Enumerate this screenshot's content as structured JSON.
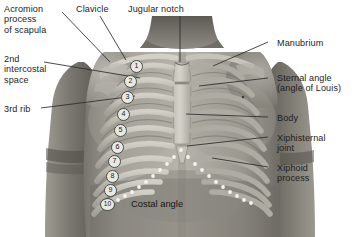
{
  "figure": {
    "background_color": "#ffffff",
    "text_color": "#1d1d1d",
    "leader_line_color": "#2b2b2b",
    "width": 364,
    "height": 237
  },
  "labels": {
    "left": [
      {
        "id": "acromion",
        "text": "Acromion\nprocess\nof scapula",
        "x": 4,
        "y": 4
      },
      {
        "id": "clavicle",
        "text": "Clavicle",
        "x": 76,
        "y": 4
      },
      {
        "id": "jugular",
        "text": "Jugular notch",
        "x": 128,
        "y": 4
      },
      {
        "id": "intercostal",
        "text": "2nd\nintercostal\nspace",
        "x": 4,
        "y": 54
      },
      {
        "id": "third-rib",
        "text": "3rd rib",
        "x": 4,
        "y": 104
      }
    ],
    "right": [
      {
        "id": "manubrium",
        "text": "Manubrium",
        "x": 277,
        "y": 38
      },
      {
        "id": "sternal-angle",
        "text": "Sternal angle\n(angle of Louis)",
        "x": 277,
        "y": 73
      },
      {
        "id": "body",
        "text": "Body",
        "x": 277,
        "y": 113
      },
      {
        "id": "xiphisternal",
        "text": "Xiphisternal\njoint",
        "x": 277,
        "y": 133
      },
      {
        "id": "xiphoid",
        "text": "Xiphoid\nprocess",
        "x": 277,
        "y": 163
      }
    ],
    "inline": [
      {
        "id": "costal-angle",
        "text": "Costal angle",
        "x": 131,
        "y": 198
      }
    ]
  },
  "rib_numbers": [
    {
      "n": "1",
      "x": 130,
      "y": 60
    },
    {
      "n": "2",
      "x": 124,
      "y": 75
    },
    {
      "n": "3",
      "x": 121,
      "y": 91
    },
    {
      "n": "4",
      "x": 117,
      "y": 108
    },
    {
      "n": "5",
      "x": 114,
      "y": 124
    },
    {
      "n": "6",
      "x": 111,
      "y": 141
    },
    {
      "n": "7",
      "x": 108,
      "y": 155
    },
    {
      "n": "8",
      "x": 106,
      "y": 170
    },
    {
      "n": "9",
      "x": 104,
      "y": 184
    },
    {
      "n": "10",
      "x": 101,
      "y": 198
    }
  ],
  "colors": {
    "skin_light": "#c9c6bf",
    "skin_mid": "#9b978f",
    "skin_dark": "#6f6b64",
    "skin_darkest": "#4b4843",
    "bone_light": "#d8d5cc",
    "bone_mid": "#b0ada4",
    "bone_shadow": "#85827a",
    "dotted_marker": "#f4f2ea"
  }
}
